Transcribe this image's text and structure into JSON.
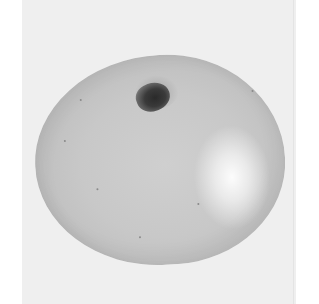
{
  "image": {
    "subject": "apple",
    "style": "grayscale photograph",
    "colors": {
      "page_background": "#ffffff",
      "photo_background": "#efefef",
      "apple_body": "#c8c8c8",
      "highlight": "#ffffff",
      "stem": "#2a2a2a"
    }
  }
}
